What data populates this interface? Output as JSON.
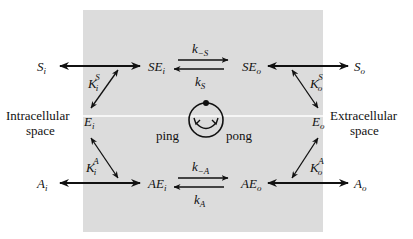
{
  "diagram": {
    "colors": {
      "membrane_region": "#dcdcdc",
      "membrane_line": "#ffffff",
      "ink": "#111111",
      "background": "#ffffff"
    },
    "regions": {
      "left_label_line1": "Intracellular",
      "left_label_line2": "space",
      "right_label_line1": "Extracellular",
      "right_label_line2": "space"
    },
    "species": {
      "S_i": {
        "base": "S",
        "sub": "i"
      },
      "SE_i": {
        "base": "SE",
        "sub": "i"
      },
      "SE_o": {
        "base": "SE",
        "sub": "o"
      },
      "S_o": {
        "base": "S",
        "sub": "o"
      },
      "E_i": {
        "base": "E",
        "sub": "i"
      },
      "E_o": {
        "base": "E",
        "sub": "o"
      },
      "A_i": {
        "base": "A",
        "sub": "i"
      },
      "AE_i": {
        "base": "AE",
        "sub": "i"
      },
      "AE_o": {
        "base": "AE",
        "sub": "o"
      },
      "A_o": {
        "base": "A",
        "sub": "o"
      }
    },
    "constants": {
      "K_i_S": {
        "base": "K",
        "sub": "i",
        "sup": "S"
      },
      "K_o_S": {
        "base": "K",
        "sub": "o",
        "sup": "S"
      },
      "K_i_A": {
        "base": "K",
        "sub": "i",
        "sup": "A"
      },
      "K_o_A": {
        "base": "K",
        "sub": "o",
        "sup": "A"
      },
      "k_minus_S": {
        "base": "k",
        "sub": "−S"
      },
      "k_S": {
        "base": "k",
        "sub": "S"
      },
      "k_minus_A": {
        "base": "k",
        "sub": "−A"
      },
      "k_A": {
        "base": "k",
        "sub": "A"
      }
    },
    "cycle": {
      "left_label": "ping",
      "right_label": "pong"
    }
  }
}
